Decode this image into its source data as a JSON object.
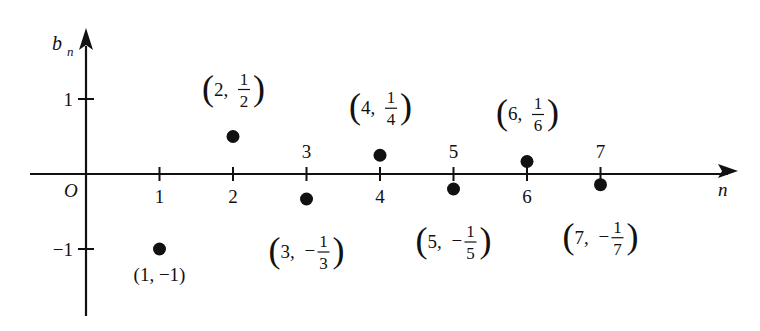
{
  "chart_data": {
    "type": "scatter",
    "title": "",
    "xlabel": "n",
    "ylabel": "b_n",
    "origin_label": "O",
    "xlim": [
      -0.8,
      8.8
    ],
    "ylim": [
      -1.75,
      1.85
    ],
    "grid": false,
    "legend": null,
    "x_ticks": [
      1,
      2,
      3,
      4,
      5,
      6,
      7
    ],
    "x_tick_labels": [
      "1",
      "2",
      "3",
      "4",
      "5",
      "6",
      "7"
    ],
    "y_ticks": [
      1,
      -1
    ],
    "y_tick_labels": [
      "1",
      "−1"
    ],
    "x": [
      1,
      2,
      3,
      4,
      5,
      6,
      7
    ],
    "values": [
      -1,
      0.5,
      -0.3333,
      0.25,
      -0.2,
      0.1667,
      -0.1429
    ],
    "annotations": [
      {
        "n": 1,
        "text": "(1, −1)",
        "whole": "1",
        "neg": true,
        "num": "",
        "den": "",
        "frac": false,
        "pos": "below"
      },
      {
        "n": 2,
        "text": "(2, 1/2)",
        "whole": "2",
        "neg": false,
        "num": "1",
        "den": "2",
        "frac": true,
        "pos": "above"
      },
      {
        "n": 3,
        "text": "(3, −1/3)",
        "whole": "3",
        "neg": true,
        "num": "1",
        "den": "3",
        "frac": true,
        "pos": "below"
      },
      {
        "n": 4,
        "text": "(4, 1/4)",
        "whole": "4",
        "neg": false,
        "num": "1",
        "den": "4",
        "frac": true,
        "pos": "above"
      },
      {
        "n": 5,
        "text": "(5, −1/5)",
        "whole": "5",
        "neg": true,
        "num": "1",
        "den": "5",
        "frac": true,
        "pos": "below"
      },
      {
        "n": 6,
        "text": "(6, 1/6)",
        "whole": "6",
        "neg": false,
        "num": "1",
        "den": "6",
        "frac": true,
        "pos": "above"
      },
      {
        "n": 7,
        "text": "(7, −1/7)",
        "whole": "7",
        "neg": true,
        "num": "1",
        "den": "7",
        "frac": true,
        "pos": "below"
      }
    ]
  },
  "colors": {
    "ink": "#111111",
    "background": "#ffffff"
  }
}
